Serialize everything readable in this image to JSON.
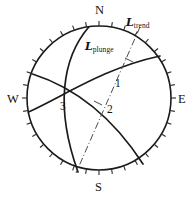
{
  "figure": {
    "name": "stereonet-lineation-diagram",
    "type": "equal-angle stereographic projection (Wulff net)",
    "background_color": "#ffffff",
    "line_color": "#1b1b1b",
    "trend_line_color": "#4a4a4a"
  },
  "net": {
    "center_x": 99,
    "center_y": 98,
    "radius": 72,
    "tick_count": 36,
    "tick_interval_degrees": 10,
    "tick_length": 5
  },
  "cardinals": [
    {
      "label": "N",
      "azimuth": 0,
      "x": 95,
      "y": 4
    },
    {
      "label": "E",
      "azimuth": 90,
      "x": 178,
      "y": 93
    },
    {
      "label": "S",
      "azimuth": 180,
      "x": 95,
      "y": 181
    },
    {
      "label": "W",
      "azimuth": 270,
      "x": 7,
      "y": 93
    }
  ],
  "lineation_labels": [
    {
      "id": "trend",
      "symbol": "L",
      "subscript": "trend",
      "x": 126,
      "y": 17
    },
    {
      "id": "plunge",
      "symbol": "L",
      "subscript": "plunge",
      "x": 85,
      "y": 41
    }
  ],
  "plane_numbers": [
    {
      "label": "1",
      "x": 115,
      "y": 78
    },
    {
      "label": "2",
      "x": 107,
      "y": 104
    },
    {
      "label": "3",
      "x": 60,
      "y": 101
    }
  ],
  "great_circles": [
    {
      "id": "great-circle-1",
      "number": "1",
      "path": "M 89 26.8 C 62 58 55 108 78 172"
    },
    {
      "id": "great-circle-2",
      "number": "2",
      "path": "M 32.5 74 C 70 86 110 113 143 164"
    },
    {
      "id": "great-circle-3",
      "number": "3",
      "path": "M 28.5 112 C 64 96 104 68 160 56"
    }
  ],
  "trend_line": {
    "id": "trend-axis",
    "path": "M 140 27 L 76 173",
    "tick_marks": [
      {
        "x1": 125,
        "y1": 58,
        "x2": 133,
        "y2": 62
      },
      {
        "x1": 94,
        "y1": 101,
        "x2": 102,
        "y2": 105
      }
    ]
  },
  "chart_data": {
    "type": "scatter",
    "title": "",
    "xlabel": "",
    "ylabel": "",
    "projection": "stereographic lower hemisphere",
    "annotations": [
      "L trend",
      "L plunge",
      "1",
      "2",
      "3",
      "N",
      "E",
      "S",
      "W"
    ]
  }
}
